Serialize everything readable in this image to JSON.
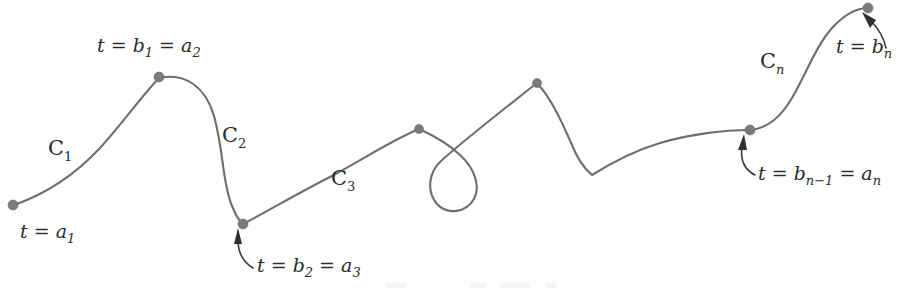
{
  "figure": {
    "stroke_color": "#6e6e6e",
    "dot_color": "#7a7a7a",
    "text_color": "#2b2b2b",
    "background_color": "#ffffff",
    "width": 908,
    "height": 291
  },
  "segments": [
    {
      "id": "C1",
      "name": "C",
      "subscript": "1",
      "label_x": 48,
      "label_y": 155
    },
    {
      "id": "C2",
      "name": "C",
      "subscript": "2",
      "label_x": 222,
      "label_y": 142
    },
    {
      "id": "C3",
      "name": "C",
      "subscript": "3",
      "label_x": 331,
      "label_y": 185
    },
    {
      "id": "Cn",
      "name": "C",
      "subscript": "n",
      "label_x": 760,
      "label_y": 68
    }
  ],
  "nodes": [
    {
      "id": "start",
      "x": 13,
      "y": 205,
      "label": "t = a",
      "label_sub": "1",
      "label_x": 20,
      "label_y": 238,
      "has_arrow": false
    },
    {
      "id": "b1a2",
      "x": 159,
      "y": 77,
      "label": "t = b",
      "label_sub": "1",
      "label2": " = a",
      "label2_sub": "2",
      "label_x": 97,
      "label_y": 52,
      "has_arrow": false
    },
    {
      "id": "b2a3",
      "x": 243,
      "y": 224,
      "label": "t = b",
      "label_sub": "2",
      "label2": " = a",
      "label2_sub": "3",
      "label_x": 257,
      "label_y": 272,
      "has_arrow": true
    },
    {
      "id": "mid1",
      "x": 419,
      "y": 129,
      "label": "",
      "has_arrow": false
    },
    {
      "id": "mid2",
      "x": 537,
      "y": 83,
      "label": "",
      "has_arrow": false
    },
    {
      "id": "bn1an",
      "x": 750,
      "y": 130,
      "label": "t = b",
      "label_sub": "n−1",
      "label2": " = a",
      "label2_sub": "n",
      "label_x": 758,
      "label_y": 180,
      "has_arrow": true
    },
    {
      "id": "end",
      "x": 868,
      "y": 8,
      "label": "t = b",
      "label_sub": "n",
      "label_x": 836,
      "label_y": 53,
      "has_arrow": true
    }
  ],
  "curve_paths": {
    "c1": "M 14,205 C 40,196 72,178 100,148 C 122,124 140,98 159,78",
    "c2": "M 159,78 C 186,72 206,88 214,116 C 224,152 222,182 232,206 C 236,216 239,221 243,224",
    "c3": "M 243,224 C 270,210 300,192 330,177 C 362,160 392,140 419,129",
    "loop": "M 419,129 C 437,137 452,147 461,156 C 474,168 481,186 474,199 C 466,213 447,215 437,204 C 426,191 429,172 441,161 C 462,142 500,112 537,83",
    "c_mid": "M 537,83 C 551,98 562,122 572,145 C 578,160 586,170 592,175 C 608,165 630,152 660,143 C 690,134 725,130 750,130",
    "cn": "M 750,130 C 768,128 780,118 792,98 C 806,74 816,46 832,28 C 845,14 858,8 868,8"
  },
  "arrows": [
    {
      "id": "arrow-b2a3",
      "leader": "M 253,268 C 243,262 238,252 238,240",
      "tip": "238,228 234,244 242,244"
    },
    {
      "id": "arrow-bn1an",
      "leader": "M 755,175 C 745,170 740,160 742,146",
      "tip": "744,134 738,150 747,150"
    },
    {
      "id": "arrow-bn",
      "leader": "M 886,48 C 884,38 878,28 870,20",
      "tip": "862,12 876,20 870,28"
    }
  ],
  "artifacts": [
    {
      "x": 385,
      "y": 283,
      "w": 22,
      "h": 5
    },
    {
      "x": 470,
      "y": 283,
      "w": 16,
      "h": 5
    },
    {
      "x": 500,
      "y": 283,
      "w": 30,
      "h": 5
    },
    {
      "x": 545,
      "y": 283,
      "w": 12,
      "h": 5
    }
  ]
}
